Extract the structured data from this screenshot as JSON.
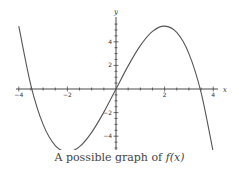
{
  "chart_data": {
    "type": "line",
    "title": "",
    "caption": "A possible graph of f(x)",
    "caption_prefix": "A possible graph of ",
    "caption_func": "f(x)",
    "xlabel": "x",
    "ylabel": "y",
    "xlim": [
      -4,
      4
    ],
    "ylim": [
      -5.6,
      5.9
    ],
    "x_ticks": [
      -4,
      -2,
      2,
      4
    ],
    "y_ticks": [
      -4,
      -2,
      2,
      4
    ],
    "x_tick_labels": [
      "-4",
      "-2",
      "2",
      "4"
    ],
    "y_tick_labels": [
      "-4",
      "-2",
      "2",
      "4"
    ],
    "grid": false,
    "legend": null,
    "series": [
      {
        "name": "f(x)",
        "description": "cubic with local minimum near (-2,-5.3) and local maximum near (2,5.3); zeros near -3.46, 0, 3.46",
        "x": [
          -4,
          -3.5,
          -3,
          -2.5,
          -2,
          -1.5,
          -1,
          -0.5,
          0,
          0.5,
          1,
          1.5,
          2,
          2.5,
          3,
          3.5,
          4
        ],
        "y": [
          5.33,
          0.29,
          -3.0,
          -4.79,
          -5.33,
          -4.88,
          -3.67,
          -1.96,
          0,
          1.96,
          3.67,
          4.88,
          5.33,
          4.79,
          3.0,
          -0.29,
          -5.33
        ]
      }
    ],
    "colors": {
      "curve": "#555555",
      "axis": "#333333"
    }
  },
  "caption": {
    "prefix": "A possible graph of ",
    "func": "f(x)"
  }
}
